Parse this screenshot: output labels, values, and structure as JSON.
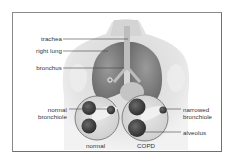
{
  "diagram": {
    "labels": {
      "trachea": "trachea",
      "right_lung": "right lung",
      "bronchus": "bronchus",
      "normal_bronchiole_line1": "normal",
      "normal_bronchiole_line2": "bronchiole",
      "narrowed_bronchiole_line1": "narrowed",
      "narrowed_bronchiole_line2": "bronchiole",
      "alveolus": "alveolus"
    },
    "insets": [
      {
        "caption": "normal"
      },
      {
        "caption": "COPD"
      }
    ],
    "colors": {
      "frame": "#8a8a8a",
      "leader_line": "#444444",
      "text": "#333333",
      "tissue_dark": "#3a3a3a",
      "skin": "#e6e6e6"
    }
  }
}
